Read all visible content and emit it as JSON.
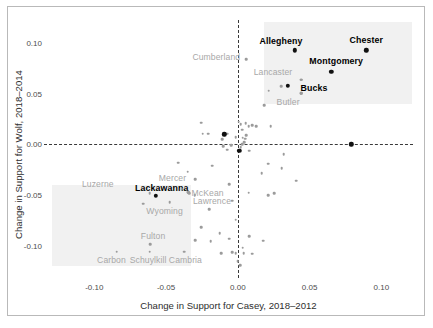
{
  "chart_data": {
    "type": "scatter",
    "title": "",
    "xlabel": "Change in Support for Casey, 2018–2012",
    "ylabel": "Change in Support for Wolf, 2018–2014",
    "xlim": [
      -0.135,
      0.122
    ],
    "ylim": [
      -0.132,
      0.123
    ],
    "xticks": [
      -0.1,
      -0.05,
      0.0,
      0.05,
      0.1
    ],
    "xticklabels": [
      "-0.10",
      "-0.05",
      "0.00",
      "0.05",
      "0.10"
    ],
    "yticks": [
      0.1,
      0.05,
      0.0,
      -0.05,
      -0.1
    ],
    "yticklabels": [
      "0.10",
      "0.05",
      "0.00",
      "-0.05",
      "-0.10"
    ],
    "grid": false,
    "legend": "none",
    "reference_lines": [
      {
        "axis": "x",
        "value": 0.0,
        "style": "dashed",
        "color": "#3a3a3a"
      },
      {
        "axis": "y",
        "value": 0.0,
        "style": "dashed",
        "color": "#3a3a3a"
      }
    ],
    "shaded_regions": [
      {
        "name": "upper-right-quadrant-highlight",
        "x0": 0.0185,
        "x1": 0.1215,
        "y0": 0.0395,
        "y1": 0.1215,
        "color": "#eeeeee"
      },
      {
        "name": "lower-left-quadrant-highlight",
        "x0": -0.1295,
        "x1": -0.0325,
        "y0": -0.1205,
        "y1": -0.0405,
        "color": "#eeeeee"
      }
    ],
    "point_colors": {
      "highlighted": "#111111",
      "regular": "#9b9b9b"
    },
    "label_colors": {
      "highlighted": "#000000",
      "regular": "#a8a8a8"
    },
    "labeled_points": [
      {
        "county": "Allegheny",
        "x": 0.0395,
        "y": 0.093,
        "highlight": true,
        "label_dx": -0.0095,
        "label_dy": 0.009
      },
      {
        "county": "Chester",
        "x": 0.0895,
        "y": 0.093,
        "highlight": true,
        "label_dx": 0.0,
        "label_dy": 0.0105
      },
      {
        "county": "Montgomery",
        "x": 0.065,
        "y": 0.072,
        "highlight": true,
        "label_dx": 0.0035,
        "label_dy": 0.0105
      },
      {
        "county": "Bucks",
        "x": 0.035,
        "y": 0.058,
        "highlight": true,
        "label_dx": 0.018,
        "label_dy": -0.002
      },
      {
        "county": "Lackawanna",
        "x": -0.057,
        "y": -0.051,
        "highlight": true,
        "label_dx": 0.004,
        "label_dy": 0.008
      },
      {
        "county": "Cumberland",
        "x": 0.006,
        "y": 0.084,
        "highlight": false,
        "label_dx": -0.021,
        "label_dy": 0.0025
      },
      {
        "county": "Lancaster",
        "x": 0.044,
        "y": 0.064,
        "highlight": false,
        "label_dx": -0.0195,
        "label_dy": 0.008
      },
      {
        "county": "Butler",
        "x": 0.044,
        "y": 0.0505,
        "highlight": false,
        "label_dx": -0.009,
        "label_dy": -0.009
      },
      {
        "county": "Luzerne",
        "x": -0.0615,
        "y": -0.048,
        "highlight": false,
        "label_dx": -0.036,
        "label_dy": 0.0085
      },
      {
        "county": "Mercer",
        "x": -0.039,
        "y": -0.044,
        "highlight": false,
        "label_dx": -0.0065,
        "label_dy": 0.0105
      },
      {
        "county": "McKean",
        "x": -0.0345,
        "y": -0.047,
        "highlight": false,
        "label_dx": 0.0135,
        "label_dy": -0.0005
      },
      {
        "county": "Lawrence",
        "x": -0.0345,
        "y": -0.047,
        "highlight": false,
        "label_dx": 0.0165,
        "label_dy": -0.009
      },
      {
        "county": "Wyoming",
        "x": -0.0475,
        "y": -0.057,
        "highlight": false,
        "label_dx": -0.0035,
        "label_dy": -0.0085
      },
      {
        "county": "Fulton",
        "x": -0.061,
        "y": -0.0985,
        "highlight": false,
        "label_dx": 0.002,
        "label_dy": 0.0085
      },
      {
        "county": "Carbon",
        "x": -0.0845,
        "y": -0.106,
        "highlight": false,
        "label_dx": -0.0035,
        "label_dy": -0.0085
      },
      {
        "county": "Schuylkill",
        "x": -0.0615,
        "y": -0.106,
        "highlight": false,
        "label_dx": -0.001,
        "label_dy": -0.0085
      },
      {
        "county": "Cambria",
        "x": -0.0375,
        "y": -0.106,
        "highlight": false,
        "label_dx": 0.001,
        "label_dy": -0.0085
      }
    ],
    "unlabeled_points": [
      {
        "x": -0.0255,
        "y": 0.0215
      },
      {
        "x": -0.0245,
        "y": 0.0105
      },
      {
        "x": -0.011,
        "y": 0.005
      },
      {
        "x": -0.0205,
        "y": 0.0105
      },
      {
        "x": -0.0075,
        "y": 0.0105
      },
      {
        "x": 0.0005,
        "y": 0.0225
      },
      {
        "x": 0.002,
        "y": 0.02
      },
      {
        "x": 0.003,
        "y": 0.0145
      },
      {
        "x": 0.0055,
        "y": 0.021
      },
      {
        "x": 0.0075,
        "y": 0.018
      },
      {
        "x": 0.01,
        "y": 0.019
      },
      {
        "x": 0.013,
        "y": 0.018
      },
      {
        "x": 0.023,
        "y": 0.018
      },
      {
        "x": 0.0185,
        "y": 0.039
      },
      {
        "x": 0.0215,
        "y": 0.053
      },
      {
        "x": 0.03,
        "y": 0.0575
      },
      {
        "x": 0.044,
        "y": 0.064
      },
      {
        "x": 0.044,
        "y": 0.0505
      },
      {
        "x": -0.0015,
        "y": 0.007
      },
      {
        "x": 0.0035,
        "y": 0.0065
      },
      {
        "x": 0.005,
        "y": 0.0055
      },
      {
        "x": 0.006,
        "y": 0.009
      },
      {
        "x": 0.0045,
        "y": 0.0025
      },
      {
        "x": 0.003,
        "y": 0.0
      },
      {
        "x": -0.0045,
        "y": -0.001
      },
      {
        "x": -0.01,
        "y": -0.0015
      },
      {
        "x": 0.002,
        "y": -0.003
      },
      {
        "x": 0.008,
        "y": -0.006
      },
      {
        "x": -0.0075,
        "y": -0.005
      },
      {
        "x": -0.0415,
        "y": -0.018
      },
      {
        "x": -0.018,
        "y": -0.021
      },
      {
        "x": -0.035,
        "y": -0.027
      },
      {
        "x": -0.0295,
        "y": -0.0345
      },
      {
        "x": 0.021,
        "y": -0.019
      },
      {
        "x": 0.0305,
        "y": -0.0235
      },
      {
        "x": 0.0165,
        "y": -0.0285
      },
      {
        "x": 0.0405,
        "y": -0.036
      },
      {
        "x": 0.0075,
        "y": -0.0475
      },
      {
        "x": 0.021,
        "y": -0.05
      },
      {
        "x": 0.0255,
        "y": -0.048
      },
      {
        "x": -0.034,
        "y": -0.048
      },
      {
        "x": -0.03,
        "y": -0.05
      },
      {
        "x": -0.066,
        "y": -0.0585
      },
      {
        "x": -0.0255,
        "y": -0.082
      },
      {
        "x": -0.0015,
        "y": -0.0745
      },
      {
        "x": -0.0125,
        "y": -0.0875
      },
      {
        "x": -0.0295,
        "y": -0.0945
      },
      {
        "x": -0.019,
        "y": -0.0955
      },
      {
        "x": -0.006,
        "y": -0.093
      },
      {
        "x": 0.008,
        "y": -0.0905
      },
      {
        "x": 0.0175,
        "y": -0.095
      },
      {
        "x": 0.0035,
        "y": -0.102
      },
      {
        "x": -0.004,
        "y": -0.1065
      },
      {
        "x": -0.0015,
        "y": -0.1075
      },
      {
        "x": 0.004,
        "y": -0.1075
      },
      {
        "x": 0.01,
        "y": -0.108
      },
      {
        "x": -0.0115,
        "y": -0.1075
      },
      {
        "x": 0.0015,
        "y": -0.1195
      },
      {
        "x": 0.0,
        "y": -0.1155
      },
      {
        "x": -0.02,
        "y": -0.064
      },
      {
        "x": 0.032,
        "y": -0.0095
      },
      {
        "x": -0.004,
        "y": -0.0555
      },
      {
        "x": -0.006,
        "y": -0.0395
      }
    ],
    "highlight_on_axis_points": [
      {
        "x": -0.0095,
        "y": 0.01
      },
      {
        "x": 0.001,
        "y": -0.006
      },
      {
        "x": 0.079,
        "y": 0.0
      }
    ]
  },
  "axis": {
    "x_label": "Change in Support for Casey, 2018–2012",
    "y_label": "Change in Support for Wolf, 2018–2014"
  }
}
